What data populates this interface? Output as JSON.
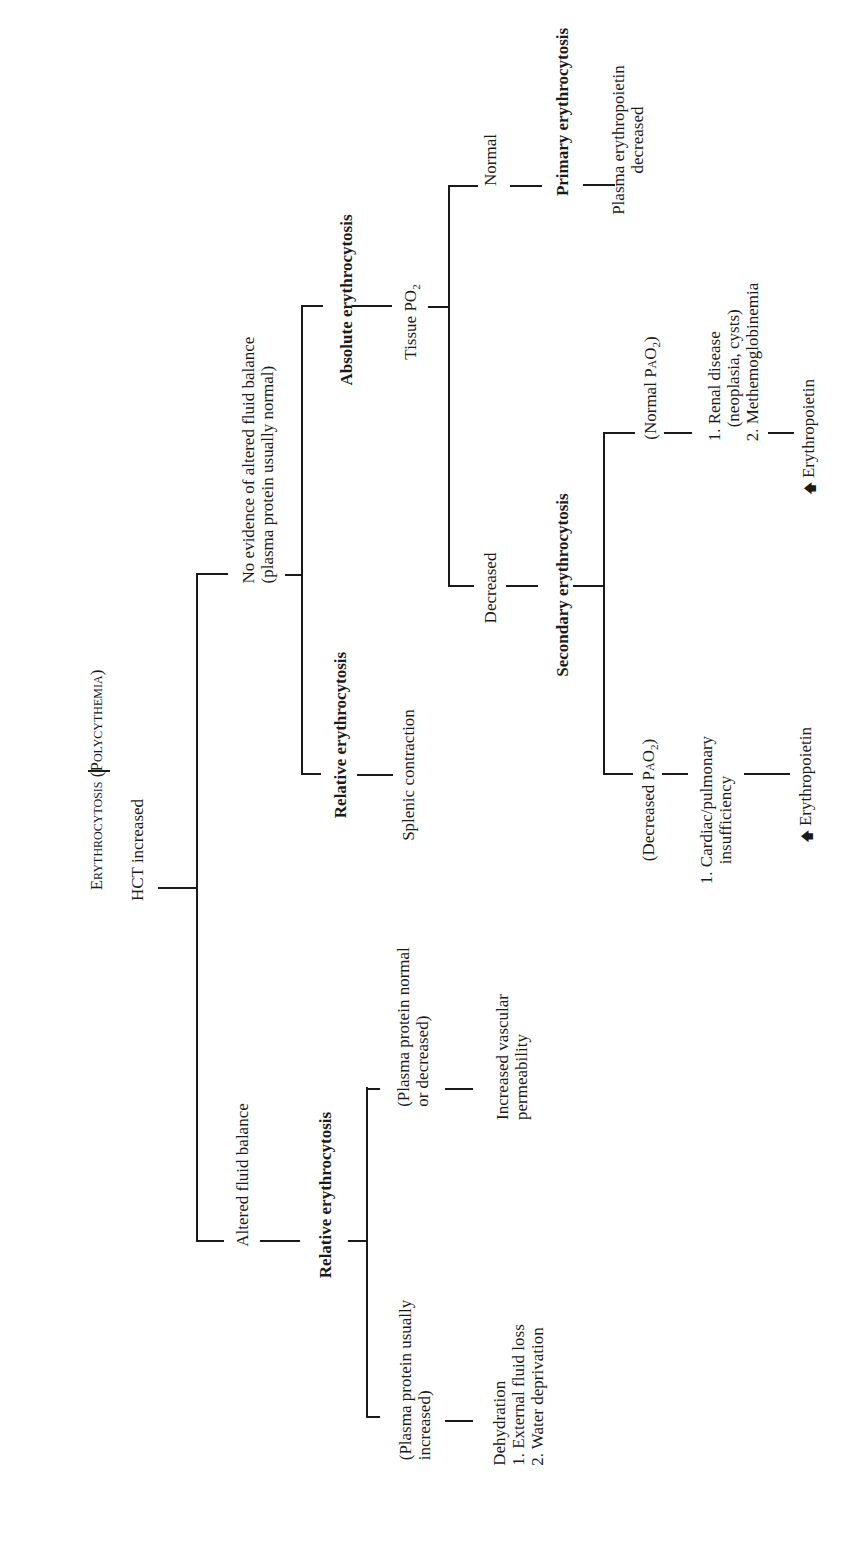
{
  "diagram": {
    "orientation": "rotated 90 degrees counter-clockwise (text reads bottom-to-top)",
    "root": {
      "label": "Erythrocytosis (Polycythemia)"
    },
    "level1": {
      "label": "HCT increased"
    },
    "branch_altered": {
      "label": "Altered fluid balance",
      "result": "Relative erythrocytosis",
      "sub_increased": {
        "condition_line1": "(Plasma protein usually",
        "condition_line2": "increased)",
        "cause_title": "Dehydration",
        "cause_1": "1. External fluid loss",
        "cause_2": "2. Water deprivation"
      },
      "sub_normal": {
        "condition_line1": "(Plasma protein normal",
        "condition_line2": "or decreased)",
        "cause_line1": "Increased vascular",
        "cause_line2": "permeability"
      }
    },
    "branch_no_evidence": {
      "label_line1": "No evidence of altered fluid balance",
      "label_line2": "(plasma protein usually normal)",
      "relative": {
        "label": "Relative erythrocytosis",
        "cause": "Splenic contraction"
      },
      "absolute": {
        "label": "Absolute erythrocytosis",
        "test_prefix": "Tissue P",
        "test_main": "O",
        "test_sub": "2",
        "normal": {
          "label": "Normal",
          "result": "Primary erythrocytosis",
          "finding_line1": "Plasma erythropoietin",
          "finding_line2": "decreased"
        },
        "decreased": {
          "label": "Decreased",
          "result": "Secondary erythrocytosis",
          "decreased_pao2": {
            "label_prefix": "(Decreased P",
            "label_main": "aO",
            "label_sub": "2",
            "label_suffix": ")",
            "cause_line1": "1. Cardiac/pulmonary",
            "cause_line2": "insufficiency",
            "finding_arrow": "up-arrow",
            "finding": "Erythropoietin"
          },
          "normal_pao2": {
            "label_prefix": "(Normal P",
            "label_main": "aO",
            "label_sub": "2",
            "label_suffix": ")",
            "cause_1_line1": "1. Renal disease",
            "cause_1_line2": "(neoplasia, cysts)",
            "cause_2": "2. Methemoglobinemia",
            "finding_arrow": "up-arrow",
            "finding": "Erythropoietin"
          }
        }
      }
    },
    "colors": {
      "line": "#1a1a1a",
      "text": "#1a1a1a",
      "background": "#ffffff"
    }
  }
}
